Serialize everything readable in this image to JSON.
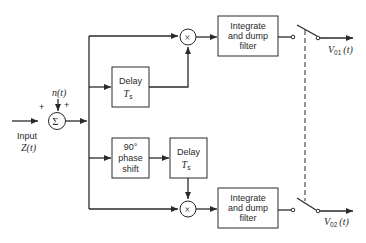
{
  "diagram": {
    "type": "block-diagram",
    "input": {
      "label": "Input",
      "signal": "Z(t)"
    },
    "noise": {
      "signal": "n(t)"
    },
    "summer": {
      "symbol": "Σ",
      "signs": [
        "+",
        "+"
      ]
    },
    "multipliers": [
      {
        "symbol": "×"
      },
      {
        "symbol": "×"
      }
    ],
    "blocks": {
      "delay_top": {
        "line1": "Delay",
        "line2": "T",
        "line2_sub": "s"
      },
      "phase_shift": {
        "line1": "90°",
        "line2": "phase",
        "line3": "shift"
      },
      "delay_bottom": {
        "line1": "Delay",
        "line2": "T",
        "line2_sub": "s"
      },
      "filter_top": {
        "line1": "Integrate",
        "line2": "and dump",
        "line3": "filter"
      },
      "filter_bottom": {
        "line1": "Integrate",
        "line2": "and dump",
        "line3": "filter"
      }
    },
    "outputs": [
      {
        "v": "V",
        "sub": "01",
        "arg": "(t)"
      },
      {
        "v": "V",
        "sub": "02",
        "arg": "(t)"
      }
    ],
    "colors": {
      "ink": "#2a2a2a",
      "background": "#ffffff"
    }
  }
}
